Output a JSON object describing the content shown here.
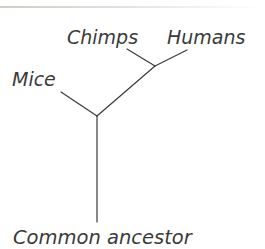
{
  "diagram": {
    "type": "phylogenetic-tree",
    "root": "Common ancestor",
    "leaves": [
      "Mice",
      "Chimps",
      "Humans"
    ],
    "labels": {
      "mice": "Mice",
      "chimps": "Chimps",
      "humans": "Humans",
      "root": "Common ancestor"
    },
    "edges": [
      {
        "from": "Common ancestor",
        "to": "node-1"
      },
      {
        "from": "node-1",
        "to": "Mice"
      },
      {
        "from": "node-1",
        "to": "node-2"
      },
      {
        "from": "node-2",
        "to": "Chimps"
      },
      {
        "from": "node-2",
        "to": "Humans"
      }
    ],
    "line_color": "#3a3a3a",
    "text_color": "#3a3a3a"
  }
}
